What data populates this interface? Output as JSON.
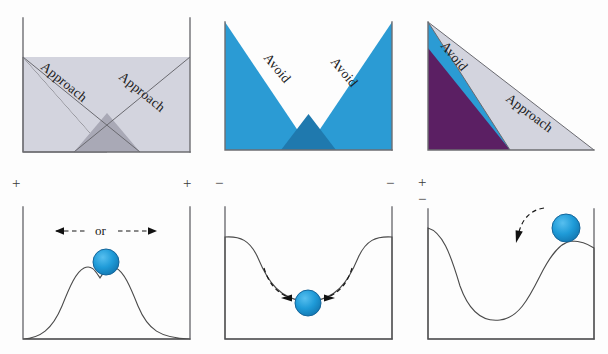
{
  "figure": {
    "width": 608,
    "height": 354,
    "background": "#fdfdfd"
  },
  "colors": {
    "gray_fill": "#d3d4de",
    "gray_overlap": "#a9a9b6",
    "blue_fill": "#2b9bd4",
    "blue_overlap": "#1f79ae",
    "purple_fill": "#5b1f63",
    "ball_blue": "#1f9bd8",
    "ball_stroke": "#14659a",
    "terrain_gray": "#b0b0b0",
    "axis_gray": "#6e6e72",
    "text_dark": "#1a1a1a",
    "sign_gray": "#3a3a3a"
  },
  "panels": {
    "top": [
      {
        "id": "approach-approach",
        "name": "approach-approach-conflict",
        "labels": [
          {
            "text": "Approach",
            "rotation": 45
          },
          {
            "text": "Approach",
            "rotation": -45
          }
        ],
        "gradient_fill": "gray",
        "description": "Two crossing approach gradients, light gray wedges with darker overlap"
      },
      {
        "id": "avoidance-avoidance",
        "name": "avoidance-avoidance-conflict",
        "labels": [
          {
            "text": "Avoid",
            "rotation": 45
          },
          {
            "text": "Avoid",
            "rotation": -45
          }
        ],
        "gradient_fill": "blue",
        "description": "Two crossing avoidance gradients, blue wedges with darker blue overlap"
      },
      {
        "id": "approach-avoidance",
        "name": "approach-avoidance-conflict",
        "labels": [
          {
            "text": "Avoid",
            "rotation": 50
          },
          {
            "text": "Approach",
            "rotation": 26
          }
        ],
        "gradient_fill": "blue-and-gray",
        "description": "A steep avoidance gradient over a shallow approach gradient, purple where they overlap"
      }
    ],
    "bottom": [
      {
        "id": "unstable-saddle",
        "name": "unstable-equilibrium-terrain",
        "signs": [
          "+",
          "+"
        ],
        "sign_layout": "corners",
        "annotation": "or",
        "arrow_style": "straight-bidirectional-dashed",
        "ball_position": "saddle-between-two-peaks",
        "description": "Ball resting in the dip between two hills; may roll either way"
      },
      {
        "id": "stable-basin",
        "name": "stable-equilibrium-terrain",
        "signs": [
          "−",
          "−"
        ],
        "sign_layout": "corners",
        "annotation": "",
        "arrow_style": "two-curved-inward-dashed",
        "ball_position": "bottom-of-valley",
        "description": "Ball resting at the bottom of a basin; returns to centre"
      },
      {
        "id": "metastable-peak",
        "name": "metastable-equilibrium-terrain",
        "signs": [
          "+",
          "−"
        ],
        "sign_layout": "stacked-top-left",
        "annotation": "",
        "arrow_style": "single-curved-leftward-dashed",
        "ball_position": "on-right-hand-peak",
        "description": "Ball perched on a ridge next to a deep valley; rolls down to the left"
      }
    ]
  }
}
